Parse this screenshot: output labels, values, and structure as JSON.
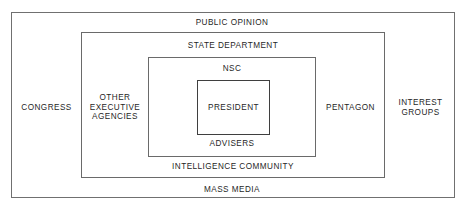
{
  "diagram": {
    "type": "concentric-nested-boxes",
    "title": "",
    "levels": [
      {
        "name": "public-opinion",
        "top_label": "PUBLIC OPINION",
        "bottom_label": "MASS MEDIA",
        "left_label": "CONGRESS",
        "right_label": "INTEREST GROUPS"
      },
      {
        "name": "state-department",
        "top_label": "STATE DEPARTMENT",
        "bottom_label": "INTELLIGENCE COMMUNITY",
        "left_label": "OTHER EXECUTIVE AGENCIES",
        "right_label": "PENTAGON"
      },
      {
        "name": "nsc",
        "top_label": "NSC",
        "bottom_label": "ADVISERS",
        "left_label": "",
        "right_label": ""
      },
      {
        "name": "president",
        "top_label": "",
        "bottom_label": "",
        "center_label": "PRESIDENT"
      }
    ],
    "labels": {
      "public_opinion": "PUBLIC OPINION",
      "mass_media": "MASS MEDIA",
      "congress": "CONGRESS",
      "interest_groups": "INTEREST\nGROUPS",
      "interest_groups_line1": "INTEREST",
      "interest_groups_line2": "GROUPS",
      "state_department": "STATE DEPARTMENT",
      "intelligence_community": "INTELLIGENCE COMMUNITY",
      "other_executive_agencies_line1": "OTHER",
      "other_executive_agencies_line2": "EXECUTIVE",
      "other_executive_agencies_line3": "AGENCIES",
      "pentagon": "PENTAGON",
      "nsc": "NSC",
      "advisers": "ADVISERS",
      "president": "PRESIDENT"
    },
    "colors": {
      "background": "#ffffff",
      "border": "#6e6e6e",
      "inner_border": "#3f3f3f",
      "text": "#1f1f1f"
    }
  }
}
